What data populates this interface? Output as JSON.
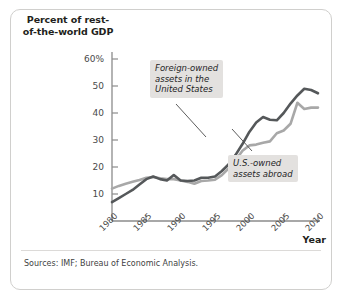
{
  "figure": {
    "y_axis_title": "Percent of\nrest-of-the-world\nGDP",
    "x_axis_title": "Year",
    "source_note": "Sources: IMF; Bureau of Economic Analysis.",
    "annotations": {
      "foreign": "Foreign-owned\nassets in the\nUnited States",
      "us_owned": "U.S.-owned\nassets abroad"
    },
    "colors": {
      "foreign_line": "#55585a",
      "us_owned_line": "#a8a8a8",
      "axis": "#8b8b8b",
      "callout_bg": "#e3e1df",
      "frame_border": "#d0cfcd",
      "text": "#231f20"
    }
  },
  "chart_data": {
    "type": "line",
    "title": "",
    "xlabel": "Year",
    "ylabel": "Percent of rest-of-the-world GDP",
    "xlim": [
      1980,
      2010
    ],
    "ylim": [
      0,
      65
    ],
    "xticks": [
      1980,
      1985,
      1990,
      1995,
      2000,
      2005,
      2010
    ],
    "yticks": [
      10,
      20,
      30,
      40,
      50,
      60
    ],
    "ytick_labels": [
      "10",
      "20",
      "30",
      "40",
      "50",
      "60%"
    ],
    "grid": false,
    "legend": "annotated-callouts",
    "x": [
      1980,
      1981,
      1982,
      1983,
      1984,
      1985,
      1986,
      1987,
      1988,
      1989,
      1990,
      1991,
      1992,
      1993,
      1994,
      1995,
      1996,
      1997,
      1998,
      1999,
      2000,
      2001,
      2002,
      2003,
      2004,
      2005,
      2006,
      2007,
      2008,
      2009,
      2010
    ],
    "series": [
      {
        "name": "Foreign-owned assets in the United States",
        "color": "#55585a",
        "values": [
          7.0,
          8.5,
          10.0,
          11.5,
          13.5,
          15.5,
          16.5,
          15.5,
          15.0,
          17.0,
          15.0,
          14.8,
          15.0,
          16.0,
          16.0,
          16.5,
          18.5,
          21.0,
          24.5,
          28.5,
          33.0,
          36.5,
          38.5,
          37.5,
          37.3,
          40.0,
          43.5,
          46.5,
          49.0,
          48.5,
          47.3
        ]
      },
      {
        "name": "U.S.-owned assets abroad",
        "color": "#a8a8a8",
        "values": [
          12.0,
          13.0,
          13.8,
          14.5,
          15.2,
          16.0,
          16.3,
          15.8,
          15.5,
          15.5,
          15.0,
          14.5,
          13.8,
          14.8,
          15.0,
          15.3,
          17.0,
          19.5,
          22.5,
          26.0,
          28.0,
          28.3,
          29.0,
          29.5,
          32.5,
          33.5,
          36.0,
          43.8,
          41.5,
          42.0,
          42.0
        ]
      }
    ]
  }
}
